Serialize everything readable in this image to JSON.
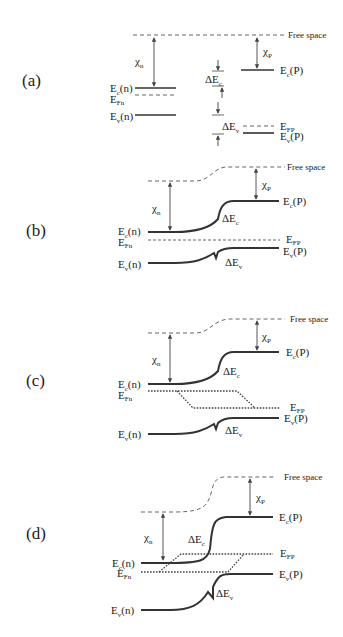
{
  "panels": [
    {
      "id": "a",
      "label": "(a)",
      "description": "Isolated n- and p-type semiconductors before contact"
    },
    {
      "id": "b",
      "label": "(b)",
      "description": "Heterojunction in equilibrium"
    },
    {
      "id": "c",
      "label": "(c)",
      "description": "Heterojunction under reverse bias with quasi-Fermi levels"
    },
    {
      "id": "d",
      "label": "(d)",
      "description": "Heterojunction under forward bias with quasi-Fermi levels"
    }
  ],
  "labels": {
    "free_space": "Free space",
    "chi_n": "χ",
    "chi_n_sub": "n",
    "chi_p": "χ",
    "chi_p_sub": "P",
    "ec_n": "E",
    "ec_n_sub": "c",
    "ec_n_suffix": "(n)",
    "ev_n": "E",
    "ev_n_sub": "v",
    "ev_n_suffix": "(n)",
    "efn": "E",
    "efn_sub": "Fn",
    "efp": "E",
    "efp_sub": "FP",
    "ec_p": "E",
    "ec_p_sub": "c",
    "ec_p_suffix": "(P)",
    "ev_p": "E",
    "ev_p_sub": "v",
    "ev_p_suffix": "(P)",
    "delta_ec": "ΔE",
    "delta_ec_sub": "c",
    "delta_ev": "ΔE",
    "delta_ev_sub": "v"
  }
}
